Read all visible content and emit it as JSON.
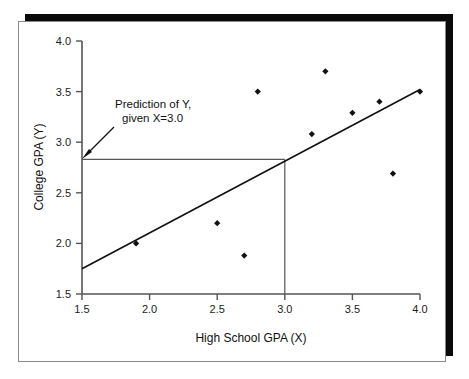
{
  "chart_data": {
    "type": "scatter",
    "title": "",
    "xlabel": "High School GPA (X)",
    "ylabel": "College GPA (Y)",
    "xlim": [
      1.5,
      4.0
    ],
    "ylim": [
      1.5,
      4.0
    ],
    "xticks": [
      "1.5",
      "2.0",
      "2.5",
      "3.0",
      "3.5",
      "4.0"
    ],
    "yticks": [
      "1.5",
      "2.0",
      "2.5",
      "3.0",
      "3.5",
      "4.0"
    ],
    "xtick_values": [
      1.5,
      2.0,
      2.5,
      3.0,
      3.5,
      4.0
    ],
    "ytick_values": [
      1.5,
      2.0,
      2.5,
      3.0,
      3.5,
      4.0
    ],
    "grid": false,
    "legend": "none",
    "points": [
      {
        "x": 1.9,
        "y": 2.0
      },
      {
        "x": 2.5,
        "y": 2.2
      },
      {
        "x": 2.7,
        "y": 1.88
      },
      {
        "x": 2.8,
        "y": 3.5
      },
      {
        "x": 3.2,
        "y": 3.08
      },
      {
        "x": 3.3,
        "y": 3.7
      },
      {
        "x": 3.5,
        "y": 3.29
      },
      {
        "x": 3.7,
        "y": 3.4
      },
      {
        "x": 3.8,
        "y": 2.69
      },
      {
        "x": 4.0,
        "y": 3.5
      }
    ],
    "regression_line": {
      "x_start": 1.5,
      "y_start": 1.75,
      "x_end": 4.0,
      "y_end": 3.52
    },
    "prediction_guides": {
      "x_value": 3.0,
      "y_value": 2.83,
      "vertical_from_y": 1.5,
      "horizontal_from_x": 1.5
    },
    "annotation": {
      "line1": "Prediction of Y,",
      "line2": "given X=3.0",
      "arrow_tip_x": 1.5,
      "arrow_tip_y": 2.83
    },
    "colors": {
      "marker": "#111111",
      "line": "#111111",
      "axis": "#555555",
      "guide": "#555555",
      "frame": "#8a8a8a",
      "shadow": "#0a0a0a",
      "background": "#ffffff"
    }
  }
}
